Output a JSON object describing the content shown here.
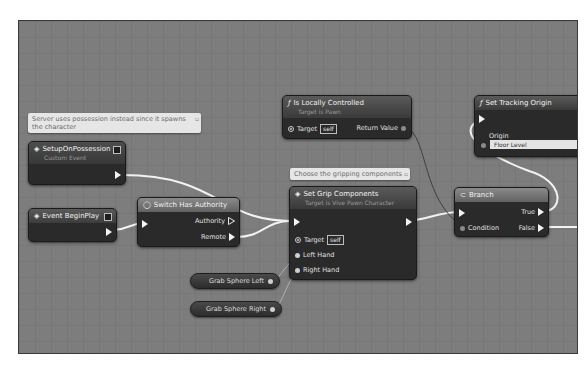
{
  "graph": {
    "comments": [
      {
        "id": "possession-note",
        "text": "Server uses possession instead since it spawns the character"
      },
      {
        "id": "gripping-note",
        "text": "Choose the gripping components"
      }
    ],
    "nodes": {
      "setup_on_possession": {
        "title": "SetupOnPossession",
        "subtitle": "Custom Event",
        "icon": "event-diamond-icon"
      },
      "event_begin_play": {
        "title": "Event BeginPlay",
        "icon": "event-diamond-icon"
      },
      "switch_has_authority": {
        "title": "Switch Has Authority",
        "icon": "switch-icon",
        "outputs": [
          "Authority",
          "Remote"
        ]
      },
      "is_locally_controlled": {
        "title": "Is Locally Controlled",
        "subtitle": "Target is Pawn",
        "icon": "function-icon",
        "target_label": "Target",
        "target_value": "self",
        "output": "Return Value"
      },
      "set_grip_components": {
        "title": "Set Grip Components",
        "subtitle": "Target is Vive Pawn Character",
        "icon": "function-icon",
        "target_label": "Target",
        "target_value": "self",
        "inputs": [
          "Left Hand",
          "Right Hand"
        ]
      },
      "branch": {
        "title": "Branch",
        "icon": "branch-icon",
        "condition": "Condition",
        "outputs": [
          "True",
          "False"
        ]
      },
      "set_tracking_origin": {
        "title": "Set Tracking Origin",
        "icon": "function-icon",
        "origin_label": "Origin",
        "origin_value": "Floor Level"
      },
      "grab_sphere_left": {
        "label": "Grab Sphere Left"
      },
      "grab_sphere_right": {
        "label": "Grab Sphere Right"
      }
    }
  },
  "colors": {
    "canvas": "#7d7d7d",
    "node_body": "#2a2a2a",
    "wire_exec": "#f2f2f2",
    "wire_data": "#a8a8a8",
    "comment_bg": "#e6e6e6"
  }
}
